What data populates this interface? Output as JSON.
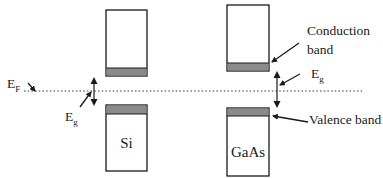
{
  "diagram": {
    "type": "energy-band-diagram",
    "fermi_level": {
      "label_main": "E",
      "label_sub": "F",
      "style": "dotted",
      "y": 91
    },
    "materials": [
      {
        "name": "Si",
        "conduction_band": {
          "x": 106,
          "y": 10,
          "w": 41,
          "h": 66,
          "shaded_edge_h": 8
        },
        "valence_band": {
          "x": 106,
          "y": 105,
          "w": 41,
          "h": 66,
          "shaded_edge_h": 9
        },
        "gap_arrow_x": 94,
        "gap_arrow_y": [
          77,
          106
        ]
      },
      {
        "name": "GaAs",
        "conduction_band": {
          "x": 227,
          "y": 5,
          "w": 42,
          "h": 66,
          "shaded_edge_h": 8
        },
        "valence_band": {
          "x": 227,
          "y": 108,
          "w": 42,
          "h": 68,
          "shaded_edge_h": 8
        },
        "gap_arrow_x": 277,
        "gap_arrow_y": [
          71,
          108
        ]
      }
    ],
    "labels": {
      "fermi": {
        "main": "E",
        "sub": "F"
      },
      "eg_si": {
        "main": "E",
        "sub": "g"
      },
      "eg_gaas": {
        "main": "E",
        "sub": "g"
      },
      "conduction_line1": "Conduction",
      "conduction_line2": "band",
      "valence": "Valence band"
    },
    "colors": {
      "line": "#1a1a1a",
      "band_edge_fill": "#8a8a8a",
      "background": "#ffffff"
    }
  }
}
